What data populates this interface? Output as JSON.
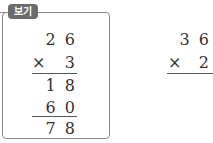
{
  "example": {
    "badge_label": "보기",
    "multiplicand": "2 6",
    "operator": "×",
    "multiplier": "3",
    "partial_1": "1 8",
    "partial_2": "6 0",
    "result": "7 8"
  },
  "problem": {
    "multiplicand": "3 6",
    "operator": "×",
    "multiplier": "2"
  }
}
